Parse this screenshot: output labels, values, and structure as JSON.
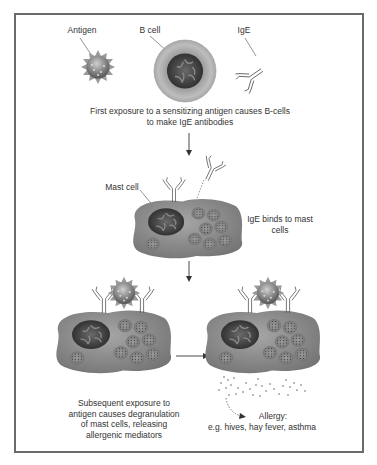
{
  "labels": {
    "antigen": "Antigen",
    "b_cell": "B cell",
    "ige": "IgE",
    "mast_cell": "Mast cell"
  },
  "captions": {
    "step1_line1": "First exposure to a sensitizing antigen causes B-cells",
    "step1_line2": "to make IgE antibodies",
    "step2_line1": "IgE binds to mast",
    "step2_line2": "cells",
    "step3_line1": "Subsequent exposure to",
    "step3_line2": "antigen causes degranulation",
    "step3_line3": "of mast cells, releasing",
    "step3_line4": "allergenic mediators",
    "outcome_line1": "Allergy:",
    "outcome_line2": "e.g. hives, hay fever, asthma"
  },
  "colors": {
    "border": "#6b6b6b",
    "cell_body": "#8e8e8e",
    "nucleus": "#3a3a3a",
    "text": "#333333"
  }
}
